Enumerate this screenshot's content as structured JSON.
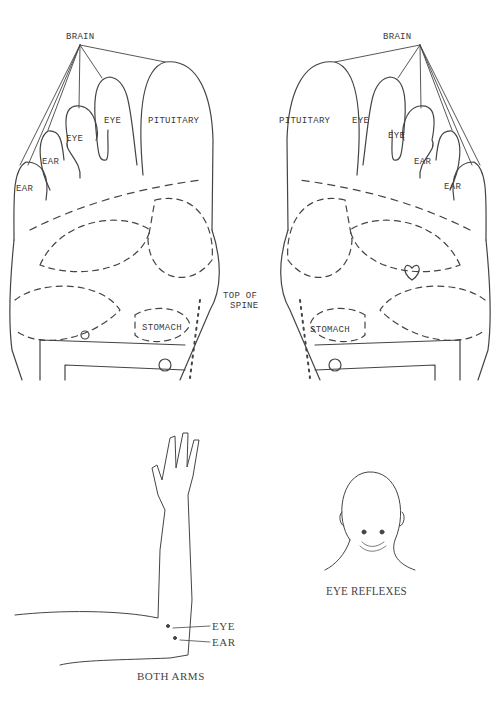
{
  "left_foot": {
    "brain": "BRAIN",
    "pituitary": "PITUITARY",
    "eye1": "EYE",
    "eye2": "EYE",
    "ear1": "EAR",
    "ear2": "EAR",
    "stomach": "STOMACH"
  },
  "right_foot": {
    "brain": "BRAIN",
    "pituitary": "PITUITARY",
    "eye1": "EYE",
    "eye2": "EYE",
    "ear1": "EAR",
    "ear2": "EAR",
    "stomach": "STOMACH"
  },
  "spine": {
    "line1": "TOP OF",
    "line2": "SPINE"
  },
  "arm": {
    "eye": "EYE",
    "ear": "EAR",
    "caption": "BOTH ARMS"
  },
  "head": {
    "caption": "EYE REFLEXES"
  },
  "colors": {
    "ink": "#3a3a3a",
    "paper": "#ffffff"
  }
}
